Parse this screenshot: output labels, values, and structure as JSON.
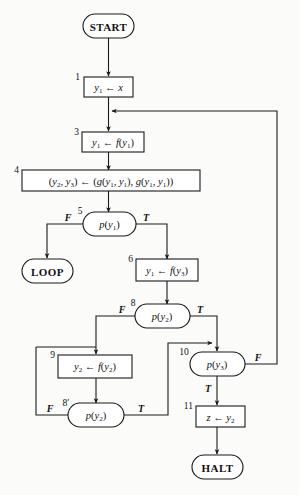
{
  "figure": {
    "type": "flowchart",
    "title": "",
    "background_color": "#fbfbf9",
    "line_color": "#1a1a1a"
  },
  "nodes": {
    "start": {
      "number": "",
      "label": "START",
      "shape": "terminator"
    },
    "n1": {
      "number": "1",
      "label": "y₁ ← x",
      "shape": "process"
    },
    "n3": {
      "number": "3",
      "label": "y₁ ← f(y₁)",
      "shape": "process"
    },
    "n4": {
      "number": "4",
      "label": "(y₂, y₃) ← (g(y₁, y₁), g(y₁, y₁))",
      "shape": "process"
    },
    "n5": {
      "number": "5",
      "label": "p(y₁)",
      "shape": "decision"
    },
    "loop": {
      "number": "",
      "label": "LOOP",
      "shape": "terminator"
    },
    "n6": {
      "number": "6",
      "label": "y₁ ← f(y₃)",
      "shape": "process"
    },
    "n8": {
      "number": "8",
      "label": "p(y₂)",
      "shape": "decision"
    },
    "n9": {
      "number": "9",
      "label": "y₂ ← f(y₂)",
      "shape": "process"
    },
    "n10": {
      "number": "10",
      "label": "p(y₃)",
      "shape": "decision"
    },
    "n8p": {
      "number": "8′",
      "label": "p(y₂)",
      "shape": "decision"
    },
    "n11": {
      "number": "11",
      "label": "z ← y₂",
      "shape": "process"
    },
    "halt": {
      "number": "",
      "label": "HALT",
      "shape": "terminator"
    }
  },
  "edge_labels": {
    "n5_false": "F",
    "n5_true": "T",
    "n8_false": "F",
    "n8_true": "T",
    "n10_false": "F",
    "n10_true": "T",
    "n8p_false": "F",
    "n8p_true": "T"
  },
  "edges": [
    {
      "from": "start",
      "to": "n1",
      "label": ""
    },
    {
      "from": "n1",
      "to": "n3",
      "label": ""
    },
    {
      "from": "n3",
      "to": "n4",
      "label": ""
    },
    {
      "from": "n4",
      "to": "n5",
      "label": ""
    },
    {
      "from": "n5",
      "to": "loop",
      "label": "F"
    },
    {
      "from": "n5",
      "to": "n6",
      "label": "T"
    },
    {
      "from": "n6",
      "to": "n8",
      "label": ""
    },
    {
      "from": "n8",
      "to": "n9",
      "label": "F"
    },
    {
      "from": "n8",
      "to": "n10",
      "label": "T"
    },
    {
      "from": "n9",
      "to": "n8p",
      "label": ""
    },
    {
      "from": "n8p",
      "to": "n9",
      "label": "F"
    },
    {
      "from": "n8p",
      "to": "n10",
      "label": "T"
    },
    {
      "from": "n10",
      "to": "n3",
      "label": "F"
    },
    {
      "from": "n10",
      "to": "n11",
      "label": "T"
    },
    {
      "from": "n11",
      "to": "halt",
      "label": ""
    }
  ]
}
